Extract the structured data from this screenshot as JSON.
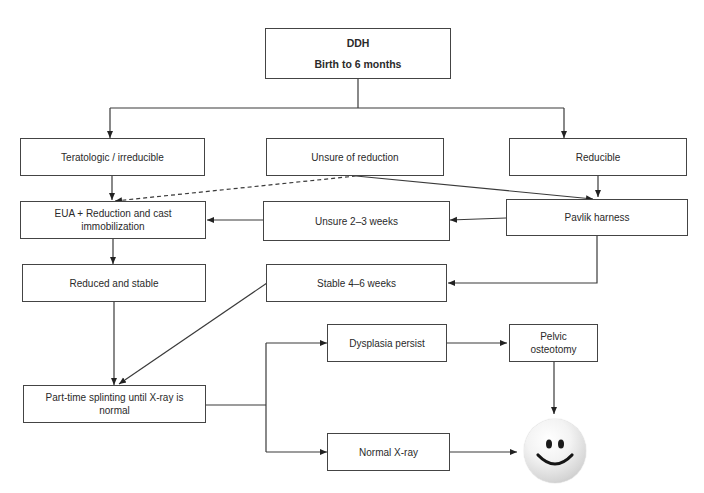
{
  "diagram": {
    "type": "flowchart",
    "nodes": {
      "root": {
        "line1": "DDH",
        "line2": "Birth to 6 months"
      },
      "teratologic": "Teratologic / irreducible",
      "unsure": "Unsure of reduction",
      "reducible": "Reducible",
      "eua": "EUA + Reduction and cast immobilization",
      "unsure_weeks": "Unsure 2–3 weeks",
      "pavlik": "Pavlik harness",
      "reduced_stable": "Reduced and stable",
      "stable_weeks": "Stable 4–6 weeks",
      "dysplasia": "Dysplasia persist",
      "pelvic": "Pelvic osteotomy",
      "splinting": "Part-time splinting until X-ray is normal",
      "normal_xray": "Normal X-ray",
      "outcome_icon": "smiley-face-icon"
    },
    "edges": [
      {
        "from": "root",
        "to": "teratologic",
        "style": "solid"
      },
      {
        "from": "root",
        "to": "reducible",
        "style": "solid"
      },
      {
        "from": "teratologic",
        "to": "eua",
        "style": "solid"
      },
      {
        "from": "unsure",
        "to": "eua",
        "style": "dashed"
      },
      {
        "from": "unsure",
        "to": "pavlik",
        "style": "solid"
      },
      {
        "from": "reducible",
        "to": "pavlik",
        "style": "solid"
      },
      {
        "from": "pavlik",
        "to": "unsure_weeks",
        "style": "solid"
      },
      {
        "from": "unsure_weeks",
        "to": "eua",
        "style": "solid"
      },
      {
        "from": "pavlik",
        "to": "stable_weeks",
        "style": "solid"
      },
      {
        "from": "eua",
        "to": "reduced_stable",
        "style": "solid"
      },
      {
        "from": "reduced_stable",
        "to": "splinting",
        "style": "solid"
      },
      {
        "from": "stable_weeks",
        "to": "splinting",
        "style": "solid"
      },
      {
        "from": "splinting",
        "to": "dysplasia",
        "style": "solid"
      },
      {
        "from": "splinting",
        "to": "normal_xray",
        "style": "solid"
      },
      {
        "from": "dysplasia",
        "to": "pelvic",
        "style": "solid"
      },
      {
        "from": "pelvic",
        "to": "outcome",
        "style": "solid"
      },
      {
        "from": "normal_xray",
        "to": "outcome",
        "style": "solid"
      }
    ],
    "colors": {
      "line": "#333333",
      "border": "#444444",
      "background": "#ffffff"
    }
  }
}
